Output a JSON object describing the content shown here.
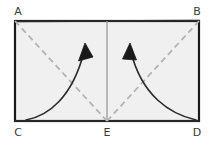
{
  "figure": {
    "kind": "geometry-diagram",
    "background_color": "#ffffff",
    "interior_fill": "#f0f0f0",
    "outline_color": "#1a1a1a",
    "dashed_color": "#b3b3b3",
    "center_line_color": "#9a9a9a",
    "arrow_color": "#2b2b2b",
    "label_color": "#3a3a3a"
  },
  "rectangle": {
    "left": 15,
    "top": 21,
    "right": 199,
    "bottom": 121,
    "stroke_width": 2.2
  },
  "vertices": [
    {
      "id": "A",
      "label": "A",
      "x": 15,
      "y": 21,
      "label_x": 18,
      "label_y": 15,
      "anchor": "middle"
    },
    {
      "id": "B",
      "label": "B",
      "x": 199,
      "y": 21,
      "label_x": 197,
      "label_y": 15,
      "anchor": "middle"
    },
    {
      "id": "C",
      "label": "C",
      "x": 15,
      "y": 121,
      "label_x": 18,
      "label_y": 134,
      "anchor": "middle"
    },
    {
      "id": "D",
      "label": "D",
      "x": 199,
      "y": 121,
      "label_x": 197,
      "label_y": 134,
      "anchor": "middle"
    },
    {
      "id": "E",
      "label": "E",
      "x": 107,
      "y": 121,
      "label_x": 107,
      "label_y": 134,
      "anchor": "middle"
    }
  ],
  "center_line": {
    "name": "vertical-midline",
    "x1": 107,
    "y1": 21,
    "x2": 107,
    "y2": 121,
    "stroke_width": 1.3
  },
  "dashed_lines": [
    {
      "name": "diagonal-a-e",
      "x1": 15,
      "y1": 21,
      "x2": 107,
      "y2": 121,
      "dash": "6 4",
      "stroke_width": 1.8
    },
    {
      "name": "diagonal-e-b",
      "x1": 107,
      "y1": 121,
      "x2": 199,
      "y2": 21,
      "dash": "6 4",
      "stroke_width": 1.8
    }
  ],
  "curved_arrows": [
    {
      "name": "fold-arrow-left",
      "path": "M 26 120 C 48 116, 72 98, 84 52",
      "tip_x": 85,
      "tip_y": 44,
      "head_points": "85,44 79,62 93,58",
      "stroke_width": 1.6
    },
    {
      "name": "fold-arrow-right",
      "path": "M 196 120 C 170 114, 142 96, 131 52",
      "tip_x": 130,
      "tip_y": 43,
      "head_points": "130,43 123,58, 137,61",
      "stroke_width": 1.6
    }
  ]
}
